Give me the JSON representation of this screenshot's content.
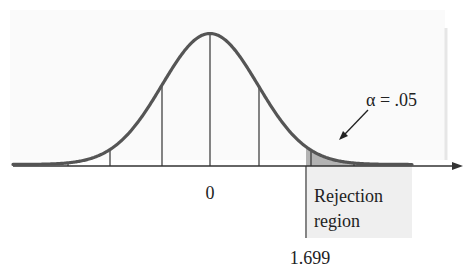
{
  "chart_data": {
    "type": "area",
    "title": "",
    "distribution": "t-distribution (bell curve)",
    "xlabel": "",
    "ylabel": "",
    "center_label": "0",
    "critical_value": 1.699,
    "critical_value_label": "1.699",
    "alpha": 0.05,
    "alpha_label": "α = .05",
    "rejection_region_label": [
      "Rejection",
      "region"
    ],
    "tail": "right",
    "grid": false,
    "x_tick_labels": [
      "0",
      "1.699"
    ]
  },
  "colors": {
    "curve": "#555555",
    "axis": "#333333",
    "shade": "#b3b3b3",
    "region_box": "#efefef",
    "text": "#222222"
  }
}
